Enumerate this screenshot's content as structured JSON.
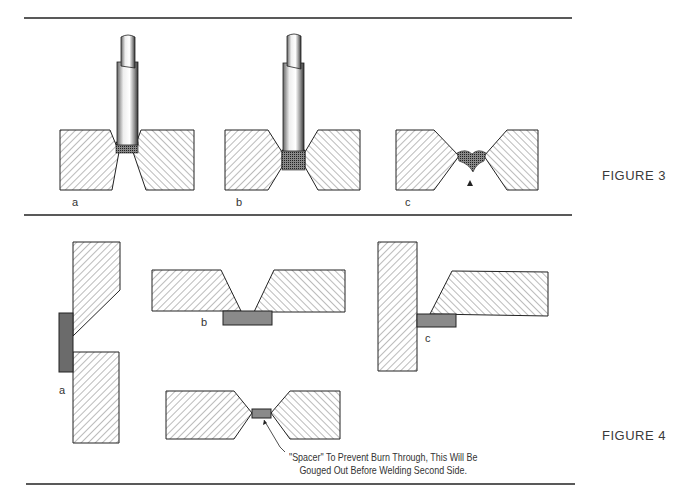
{
  "figure3": {
    "title": "FIGURE 3",
    "panels": [
      {
        "label": "a",
        "description": "electrode depositing root pass with gap between beveled plates"
      },
      {
        "label": "b",
        "description": "electrode with weld filling root face gap"
      },
      {
        "label": "c",
        "description": "burn through with molten metal dripping"
      }
    ]
  },
  "figure4": {
    "title": "FIGURE 4",
    "panels": [
      {
        "label": "a",
        "description": "vertical joint with backing bar"
      },
      {
        "label": "b",
        "description": "single-V butt joint with backing strip"
      },
      {
        "label": "c",
        "description": "T-joint with backing bar"
      }
    ],
    "spacer_note_line1": "\"Spacer\" To Prevent Burn Through, This Will Be",
    "spacer_note_line2": "Gouged Out Before Welding Second Side."
  },
  "colors": {
    "line": "#222222",
    "hatch": "#555555",
    "backing": "#8a8a8a",
    "weld": "#3a3a3a"
  }
}
